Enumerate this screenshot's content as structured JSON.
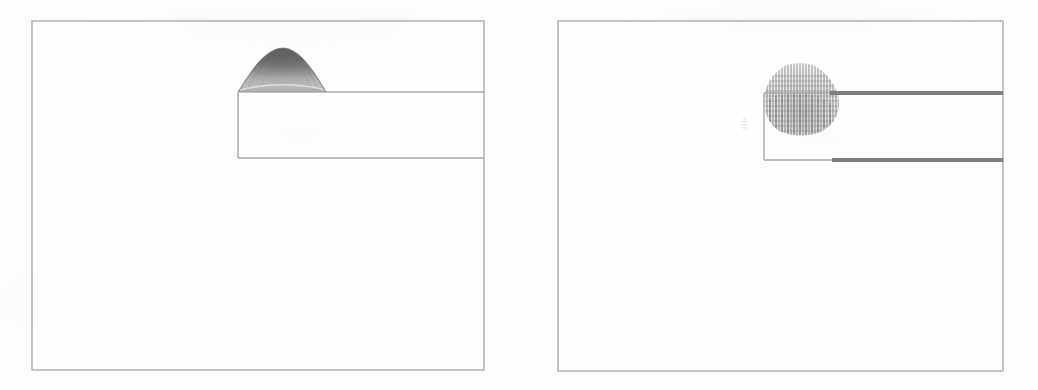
{
  "figure": {
    "title": "",
    "caption": "",
    "background_color": "#ffffff",
    "panel_count": 2,
    "frame_color": "#7a7a7a",
    "wall_color": "#3a3a3a",
    "field_color": "#2b2b2b"
  },
  "panels": [
    {
      "id": "left",
      "label": "",
      "plot_type": "contour",
      "description": "Greyscale contour / surface hump over backward-facing step channel",
      "frame": {
        "x": 32,
        "y": 21,
        "width": 452,
        "height": 349
      },
      "geometry": {
        "step_wall_x": 238,
        "upper_wall_y": 92,
        "lower_wall_y": 158,
        "upper_wall_x_end": 484,
        "lower_wall_x_end": 484,
        "wall_style": "thin"
      },
      "feature": {
        "type": "contour-hump",
        "center_x": 282,
        "base_y": 92,
        "half_width": 45,
        "height": 38,
        "peak_shade": "#1a1a1a",
        "base_shade": "#d8d8d8"
      }
    },
    {
      "id": "right",
      "label": "",
      "plot_type": "quiver",
      "description": "Vector / velocity field (quiver) plot over the same backward-facing step channel with thick wall boundaries",
      "frame": {
        "x": 558,
        "y": 21,
        "width": 445,
        "height": 350
      },
      "geometry": {
        "step_wall_x": 764,
        "upper_wall_y": 93,
        "lower_wall_y": 160,
        "upper_wall_x_start": 830,
        "upper_wall_x_end": 1003,
        "lower_wall_x_start": 832,
        "lower_wall_x_end": 1003,
        "wall_style": "thick"
      },
      "feature": {
        "type": "vector-field-blob",
        "center_x": 800,
        "base_y": 100,
        "half_width": 40,
        "height": 52,
        "arrow_rows": 17,
        "arrow_cols": 25,
        "dominant_direction": "vertical",
        "density_shade": "#343434"
      },
      "stray_vectors": {
        "x": 742,
        "y": 124,
        "count": 4
      }
    }
  ],
  "chart_data": [
    {
      "type": "contour",
      "title": "",
      "xlabel": "",
      "ylabel": "",
      "panel": "left",
      "domain_shape": "backward-facing-step channel",
      "xlim": [
        0,
        1
      ],
      "ylim": [
        0,
        1
      ],
      "grid": false,
      "legend": "none",
      "annotations": [],
      "step_profile": {
        "inlet_top_y": 0.0,
        "step_corner_x": 0.456,
        "step_top_y": 0.203,
        "step_bottom_y": 0.392,
        "outlet_x": 1.0
      },
      "contour_hump": {
        "description": "dark-to-light shaded hump rising above the step-top wall line",
        "x_center": 0.553,
        "x_half_width": 0.1,
        "peak_height": 0.109,
        "levels": [
          0.1,
          0.25,
          0.45,
          0.65,
          0.85,
          1.0
        ],
        "shading": "greyscale, darkest at crest"
      }
    },
    {
      "type": "quiver",
      "title": "",
      "xlabel": "",
      "ylabel": "",
      "panel": "right",
      "domain_shape": "backward-facing-step channel",
      "xlim": [
        0,
        1
      ],
      "ylim": [
        0,
        1
      ],
      "grid": false,
      "legend": "none",
      "annotations": [],
      "step_profile": {
        "inlet_top_y": 0.0,
        "step_corner_x": 0.463,
        "step_top_y": 0.206,
        "step_bottom_y": 0.397,
        "outlet_x": 1.0
      },
      "vector_field": {
        "description": "dense cluster of near-vertical velocity vectors forming a dome above and across the step corner",
        "x_center": 0.544,
        "x_half_width": 0.09,
        "top_y": 0.137,
        "bottom_y": 0.286,
        "nx": 25,
        "ny": 17,
        "mean_direction_deg": 90,
        "magnitude_peak_region": "lower half of dome"
      }
    }
  ]
}
